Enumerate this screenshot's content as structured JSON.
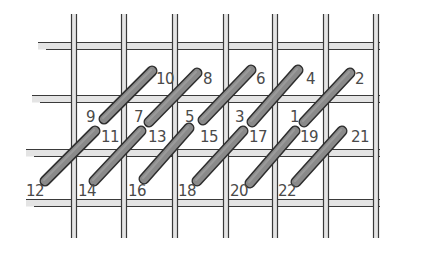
{
  "diagram": {
    "type": "canvas-stitch-chart",
    "colors": {
      "background": "#ffffff",
      "thread_fill": "#e4e4e4",
      "thread_outline": "#3a3a3a",
      "stitch_fill": "#8a8a8a",
      "stitch_outline": "#2e2e2e",
      "label": "#4a4a4a"
    },
    "grid": {
      "vertical_threads_x": [
        74,
        124,
        175,
        226,
        275,
        326,
        376
      ],
      "vertical_span": [
        14,
        238
      ],
      "horizontal_threads_y": [
        46,
        99,
        153,
        203
      ],
      "horizontal_spans": [
        [
          38,
          380
        ],
        [
          32,
          380
        ],
        [
          26,
          380
        ],
        [
          26,
          380
        ]
      ]
    },
    "stitches": [
      {
        "id": "s-10-9",
        "row": "top",
        "from": "10",
        "to": "9",
        "x1": 152,
        "y1": 71,
        "x2": 104,
        "y2": 119
      },
      {
        "id": "s-8-7",
        "row": "top",
        "from": "8",
        "to": "7",
        "x1": 197,
        "y1": 73,
        "x2": 149,
        "y2": 122
      },
      {
        "id": "s-6-5",
        "row": "top",
        "from": "6",
        "to": "5",
        "x1": 251,
        "y1": 70,
        "x2": 203,
        "y2": 120
      },
      {
        "id": "s-4-3",
        "row": "top",
        "from": "4",
        "to": "3",
        "x1": 298,
        "y1": 70,
        "x2": 252,
        "y2": 122
      },
      {
        "id": "s-2-1",
        "row": "top",
        "from": "2",
        "to": "1",
        "x1": 350,
        "y1": 73,
        "x2": 304,
        "y2": 122
      },
      {
        "id": "s-11-12",
        "row": "bottom",
        "from": "11",
        "to": "12",
        "x1": 95,
        "y1": 131,
        "x2": 45,
        "y2": 181
      },
      {
        "id": "s-13-14",
        "row": "bottom",
        "from": "13",
        "to": "14",
        "x1": 141,
        "y1": 131,
        "x2": 94,
        "y2": 181
      },
      {
        "id": "s-15-16",
        "row": "bottom",
        "from": "15",
        "to": "16",
        "x1": 189,
        "y1": 128,
        "x2": 144,
        "y2": 179
      },
      {
        "id": "s-17-18",
        "row": "bottom",
        "from": "17",
        "to": "18",
        "x1": 243,
        "y1": 131,
        "x2": 197,
        "y2": 181
      },
      {
        "id": "s-19-20",
        "row": "bottom",
        "from": "19",
        "to": "20",
        "x1": 295,
        "y1": 131,
        "x2": 250,
        "y2": 183
      },
      {
        "id": "s-21-22",
        "row": "bottom",
        "from": "21",
        "to": "22",
        "x1": 342,
        "y1": 131,
        "x2": 296,
        "y2": 182
      }
    ],
    "labels": [
      {
        "text": "10",
        "x": 156,
        "y": 84
      },
      {
        "text": "8",
        "x": 203,
        "y": 84
      },
      {
        "text": "6",
        "x": 256,
        "y": 84
      },
      {
        "text": "4",
        "x": 306,
        "y": 84
      },
      {
        "text": "2",
        "x": 355,
        "y": 84
      },
      {
        "text": "9",
        "x": 86,
        "y": 122
      },
      {
        "text": "7",
        "x": 134,
        "y": 122
      },
      {
        "text": "5",
        "x": 185,
        "y": 122
      },
      {
        "text": "3",
        "x": 235,
        "y": 122
      },
      {
        "text": "1",
        "x": 290,
        "y": 122
      },
      {
        "text": "11",
        "x": 101,
        "y": 142
      },
      {
        "text": "13",
        "x": 148,
        "y": 142
      },
      {
        "text": "15",
        "x": 200,
        "y": 142
      },
      {
        "text": "17",
        "x": 249,
        "y": 142
      },
      {
        "text": "19",
        "x": 300,
        "y": 142
      },
      {
        "text": "21",
        "x": 351,
        "y": 142
      },
      {
        "text": "12",
        "x": 26,
        "y": 196
      },
      {
        "text": "14",
        "x": 78,
        "y": 196
      },
      {
        "text": "16",
        "x": 128,
        "y": 196
      },
      {
        "text": "18",
        "x": 178,
        "y": 196
      },
      {
        "text": "20",
        "x": 230,
        "y": 196
      },
      {
        "text": "22",
        "x": 278,
        "y": 196
      }
    ]
  }
}
